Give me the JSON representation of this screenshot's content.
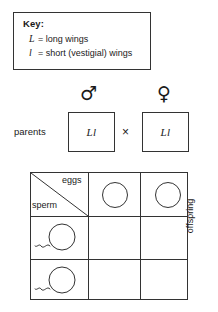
{
  "key": {
    "title": "Key:",
    "entries": [
      {
        "symbol": "L",
        "equals": "=",
        "description": "long wings"
      },
      {
        "symbol": "l",
        "equals": "=",
        "description": "short (vestigial) wings"
      }
    ]
  },
  "cross": {
    "parents_label": "parents",
    "male_symbol": "♂",
    "female_symbol": "♀",
    "male_genotype": "Ll",
    "female_genotype": "Ll",
    "cross_operator": "×"
  },
  "punnett": {
    "eggs_label": "eggs",
    "sperm_label": "sperm",
    "offspring_label": "offspring",
    "egg_cells": [
      {
        "content": ""
      },
      {
        "content": ""
      }
    ],
    "sperm_cells": [
      {
        "content": ""
      },
      {
        "content": ""
      }
    ],
    "offspring_cells": [
      {
        "content": ""
      },
      {
        "content": ""
      },
      {
        "content": ""
      },
      {
        "content": ""
      }
    ]
  },
  "colors": {
    "line": "#333333",
    "text": "#1a1a1a",
    "background": "#ffffff"
  }
}
